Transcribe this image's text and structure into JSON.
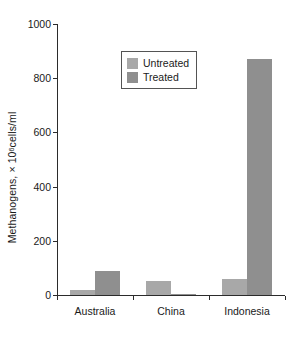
{
  "chart_data": {
    "type": "bar",
    "title": "",
    "xlabel": "",
    "ylabel_text": "Methanogens, × 10",
    "ylabel_sup": "6",
    "ylabel_tail": " cells/ml",
    "ylabel_full": "Methanogens, × 10⁶ cells/ml",
    "categories": [
      "Australia",
      "China",
      "Indonesia"
    ],
    "series": [
      {
        "name": "Untreated",
        "color": "#a8a8a8",
        "values": [
          20,
          50,
          60
        ]
      },
      {
        "name": "Treated",
        "color": "#8f8f8f",
        "values": [
          90,
          5,
          870
        ]
      }
    ],
    "ylim": [
      0,
      1000
    ],
    "yticks": [
      0,
      200,
      400,
      600,
      800,
      1000
    ],
    "ytick_labels": [
      "0",
      "200",
      "400",
      "600",
      "800",
      "1000"
    ],
    "grid": false,
    "legend_position": "upper-left-inside",
    "legend_entries": [
      "Untreated",
      "Treated"
    ]
  },
  "axis": {
    "line_color": "#2b2b2b",
    "tick_color": "#2b2b2b"
  }
}
